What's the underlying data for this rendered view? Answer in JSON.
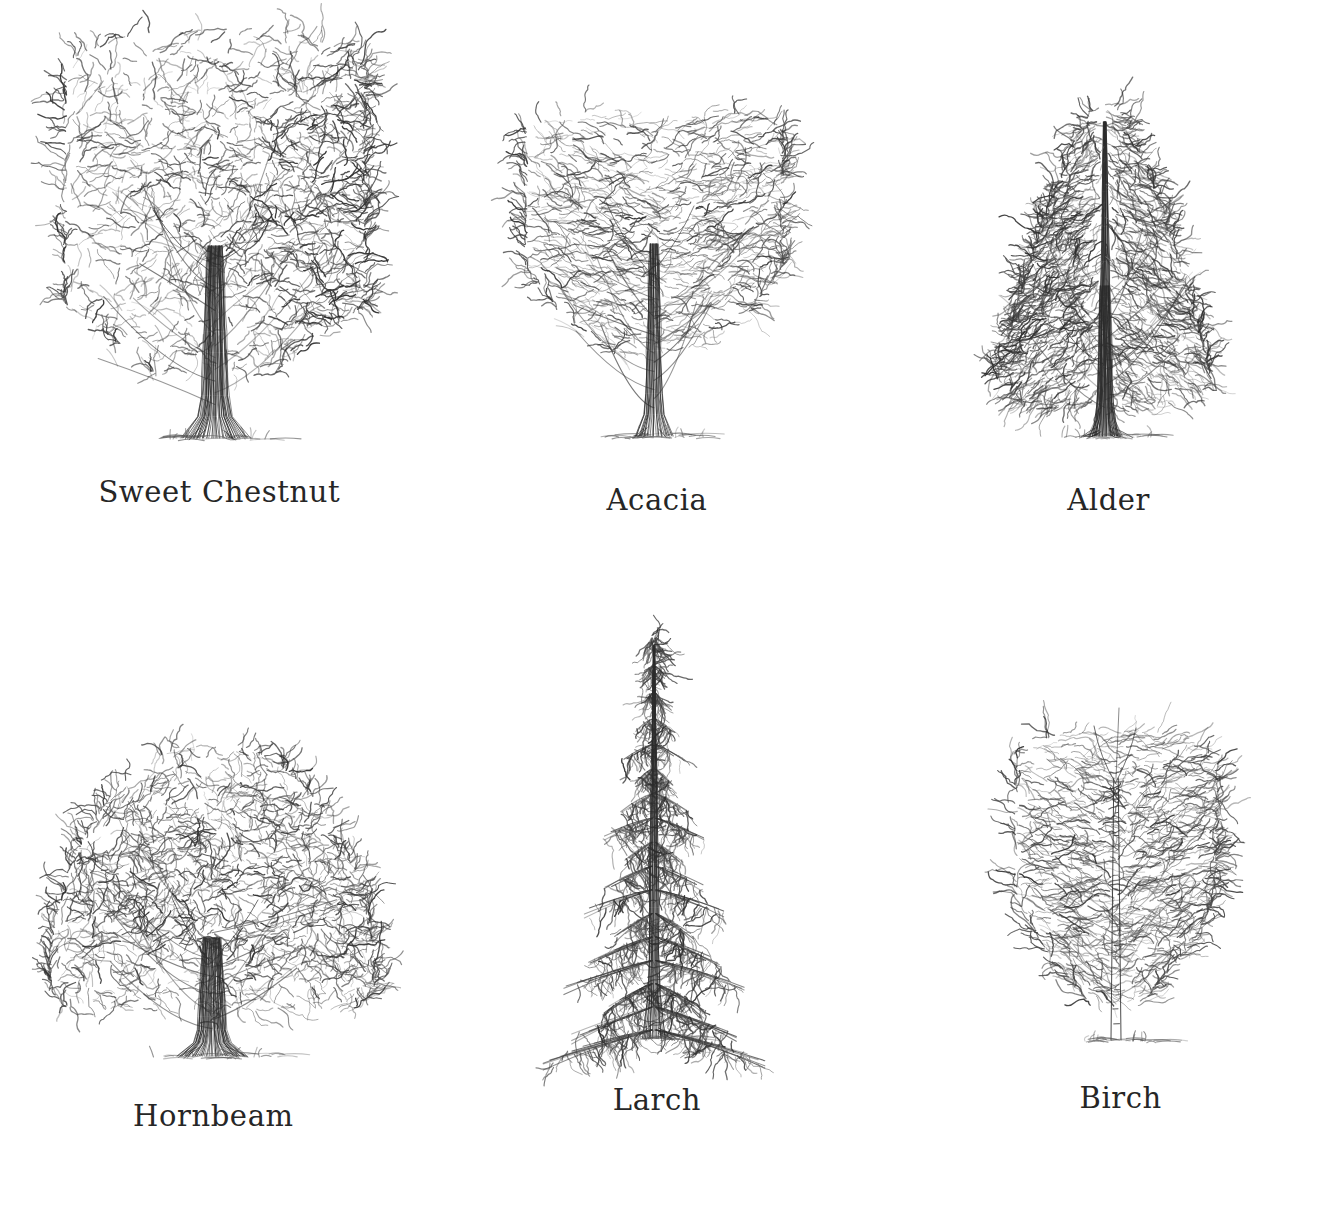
{
  "page": {
    "background_color": "#ffffff",
    "ink_color": "#2b2b2b",
    "caption_color": "#262626",
    "layout": "3-column x 2-row grid of pencil tree sketches with captions beneath"
  },
  "grid": {
    "columns": 3,
    "rows": 2
  },
  "trees": [
    {
      "id": "sweet-chestnut",
      "label": "Sweet Chestnut",
      "form": "broad-spreading",
      "crown_shape": "broad billowing dome, wider than tall, heavy shading on right side",
      "trunk": "stout, short, dark vertically-striated bole with flared buttressed base",
      "shading": "dark",
      "art": {
        "width": 340,
        "height": 450,
        "ground_y": 432,
        "trunk_top": 300,
        "trunk_half_width": 15,
        "crown_cx": 168,
        "crown_cy": 198,
        "crown_rx": 150,
        "crown_ry": 172,
        "clump_count": 150,
        "dark_side": "right",
        "seed": 11
      }
    },
    {
      "id": "acacia",
      "label": "Acacia",
      "form": "layered-tiered",
      "crown_shape": "flat-topped rounded crown built from horizontal tiers of foliage",
      "trunk": "slender tapering trunk forking low with fine ascending limbs",
      "shading": "light",
      "art": {
        "width": 290,
        "height": 360,
        "ground_y": 340,
        "trunk_top": 218,
        "trunk_half_width": 9,
        "crown_cx": 142,
        "crown_cy": 136,
        "crown_rx": 128,
        "crown_ry": 122,
        "clump_count": 118,
        "dark_side": "none",
        "seed": 27
      }
    },
    {
      "id": "alder",
      "label": "Alder",
      "form": "conical",
      "crown_shape": "narrow pyramidal / conical crown, pointed apex, dense dark hatching",
      "trunk": "straight central leader running to the top of the crown",
      "shading": "dark",
      "art": {
        "width": 250,
        "height": 360,
        "ground_y": 340,
        "trunk_top": 30,
        "trunk_half_width": 7,
        "crown_cx": 120,
        "crown_cy": 160,
        "crown_rx": 112,
        "crown_ry": 152,
        "clump_count": 170,
        "dark_side": "left",
        "seed": 43
      }
    },
    {
      "id": "hornbeam",
      "label": "Hornbeam",
      "form": "dome",
      "crown_shape": "dense rounded mushroom dome, feathery flowing strokes, broad base",
      "trunk": "short stout trunk dividing into two main limbs just above the ground",
      "shading": "medium",
      "art": {
        "width": 360,
        "height": 350,
        "ground_y": 330,
        "trunk_top": 252,
        "trunk_half_width": 16,
        "crown_cx": 178,
        "crown_cy": 156,
        "crown_rx": 162,
        "crown_ry": 140,
        "clump_count": 160,
        "dark_side": "none",
        "seed": 59
      }
    },
    {
      "id": "larch",
      "label": "Larch",
      "form": "conifer-spire",
      "crown_shape": "narrow conifer spire, drooping horizontal branch tiers, open airy",
      "trunk": "straight dark vertical leader from base to tip",
      "shading": "light",
      "art": {
        "width": 230,
        "height": 440,
        "ground_y": 418,
        "trunk_top": 22,
        "trunk_half_width": 6,
        "crown_cx": 112,
        "crown_cy": 220,
        "crown_rx": 104,
        "crown_ry": 200,
        "tier_count": 17,
        "dark_side": "none",
        "seed": 71
      }
    },
    {
      "id": "birch",
      "label": "Birch",
      "form": "weeping-oval",
      "crown_shape": "light airy oval crown with pendulous weeping outer twigs",
      "trunk": "slender pale trunk with dark horizontal bark bands, forks high",
      "shading": "light",
      "art": {
        "width": 230,
        "height": 340,
        "ground_y": 322,
        "trunk_top": 60,
        "trunk_half_width": 5,
        "crown_cx": 110,
        "crown_cy": 150,
        "crown_rx": 100,
        "crown_ry": 140,
        "clump_count": 130,
        "dark_side": "none",
        "seed": 89
      }
    }
  ]
}
